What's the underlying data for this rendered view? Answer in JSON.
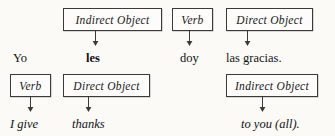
{
  "diagram": {
    "type": "sentence-grammar-annotation",
    "background_color": "#fbfaf7",
    "box_border_color": "#3a3a38",
    "text_color": "#17171a",
    "sentence_spanish": "Yo les doy las gracias.",
    "sentence_english": "I give thanks to you (all).",
    "top_labels": [
      {
        "text": "Indirect Object",
        "x": 63,
        "y": 8,
        "w": 99,
        "h": 23,
        "arrow_x": 95
      },
      {
        "text": "Verb",
        "x": 172,
        "y": 8,
        "w": 41,
        "h": 23,
        "arrow_x": 189
      },
      {
        "text": "Direct Object",
        "x": 226,
        "y": 8,
        "w": 87,
        "h": 23,
        "arrow_x": 247
      }
    ],
    "spanish_words": [
      {
        "text": "Yo",
        "x": 13,
        "y": 52,
        "bold": false
      },
      {
        "text": "les",
        "x": 86,
        "y": 52,
        "bold": true
      },
      {
        "text": "doy",
        "x": 180,
        "y": 52,
        "bold": false
      },
      {
        "text": "las gracias.",
        "x": 226,
        "y": 52,
        "bold": false
      }
    ],
    "bottom_labels": [
      {
        "text": "Verb",
        "x": 10,
        "y": 74,
        "w": 41,
        "h": 23,
        "arrow_x": 30
      },
      {
        "text": "Direct Object",
        "x": 63,
        "y": 74,
        "w": 87,
        "h": 23,
        "arrow_x": 88
      },
      {
        "text": "Indirect Object",
        "x": 226,
        "y": 74,
        "w": 92,
        "h": 23,
        "arrow_x": 262
      }
    ],
    "english_words": [
      {
        "text": "I  give",
        "x": 10,
        "y": 118
      },
      {
        "text": "thanks",
        "x": 72,
        "y": 118
      },
      {
        "text": "to you (all).",
        "x": 241,
        "y": 118
      }
    ]
  }
}
